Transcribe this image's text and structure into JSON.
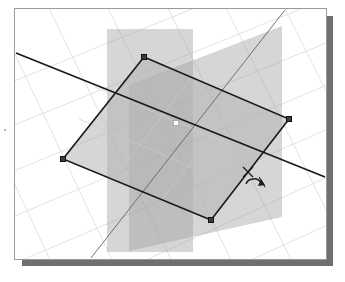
{
  "app": {
    "title": "3D Modeling Viewport",
    "panel_name": "perspective-viewport"
  },
  "viewport": {
    "background_color": "#ffffff",
    "border_color": "#9a9a9a",
    "shadow_color": "#6f6f70",
    "grid": {
      "visible": true,
      "color": "#e2e2e2",
      "minor_color": "#efefef",
      "description": "perspective ground grid"
    },
    "bounds": {
      "x": 14,
      "y": 8,
      "width": 311,
      "height": 250
    }
  },
  "scene": {
    "type": "3d-perspective",
    "objects": [
      {
        "name": "selected-face",
        "kind": "quadrilateral-face",
        "selected": true,
        "fill": "#b4b4b4",
        "fill_opacity": 0.55,
        "edge_color": "#1a1a1a",
        "edge_width": 1.6,
        "vertices": [
          {
            "label": "top-grip",
            "x": 143,
            "y": 56
          },
          {
            "label": "right-grip",
            "x": 288,
            "y": 118
          },
          {
            "label": "bottom-grip",
            "x": 210,
            "y": 219
          },
          {
            "label": "left-grip",
            "x": 62,
            "y": 158
          }
        ],
        "center": {
          "label": "center-grip",
          "x": 175,
          "y": 122
        }
      },
      {
        "name": "construction-plane-a",
        "kind": "vertical-plane",
        "fill": "#9d9d9d",
        "fill_opacity": 0.42,
        "corners": [
          {
            "x": 106,
            "y": 28
          },
          {
            "x": 192,
            "y": 28
          },
          {
            "x": 192,
            "y": 251
          },
          {
            "x": 106,
            "y": 251
          }
        ]
      },
      {
        "name": "construction-plane-b",
        "kind": "vertical-plane",
        "fill": "#9d9d9d",
        "fill_opacity": 0.42,
        "corners": [
          {
            "x": 128,
            "y": 84
          },
          {
            "x": 281,
            "y": 25
          },
          {
            "x": 281,
            "y": 216
          },
          {
            "x": 128,
            "y": 250
          }
        ]
      },
      {
        "name": "axis-line-primary",
        "kind": "line",
        "color": "#1a1a1a",
        "width": 1.8,
        "from": {
          "x": 15,
          "y": 52
        },
        "to": {
          "x": 324,
          "y": 176
        }
      },
      {
        "name": "axis-line-secondary",
        "kind": "line",
        "color": "#636363",
        "width": 0.9,
        "from": {
          "x": 284,
          "y": 9
        },
        "to": {
          "x": 90,
          "y": 257
        }
      }
    ],
    "grips": {
      "style": "square-black-handle",
      "size": 5,
      "color": "#111111",
      "count": 4
    }
  },
  "cursor": {
    "name": "rotate-cursor",
    "glyph": "rotate",
    "position": {
      "x": 252,
      "y": 174
    },
    "description": "rotate / orbit manipulation cursor"
  },
  "colors": {
    "face_gray": "#b4b4b4",
    "plane_gray": "#9d9d9d",
    "edge_black": "#1a1a1a",
    "grid_gray": "#e2e2e2",
    "panel_shadow": "#6f6f70",
    "panel_border": "#9a9a9a"
  }
}
